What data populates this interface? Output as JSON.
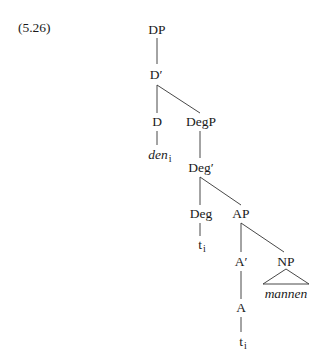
{
  "header_fragment": "",
  "example": {
    "number": "(5.26)"
  },
  "tree": {
    "nodes": {
      "DP": "DP",
      "D_bar": "D′",
      "D": "D",
      "den": "den",
      "den_index": "i",
      "DegP": "DegP",
      "Deg_bar": "Deg′",
      "Deg": "Deg",
      "t1": "t",
      "t1_index": "i",
      "AP": "AP",
      "A_bar": "A′",
      "NP": "NP",
      "mannen": "mannen",
      "A": "A",
      "t2": "t",
      "t2_index": "i"
    },
    "edges": [
      [
        "DP",
        "D′"
      ],
      [
        "D′",
        "D"
      ],
      [
        "D′",
        "DegP"
      ],
      [
        "D",
        "den_i"
      ],
      [
        "DegP",
        "Deg′"
      ],
      [
        "Deg′",
        "Deg"
      ],
      [
        "Deg′",
        "AP"
      ],
      [
        "Deg",
        "t_i"
      ],
      [
        "AP",
        "A′"
      ],
      [
        "AP",
        "NP"
      ],
      [
        "NP",
        "mannen (triangle)"
      ],
      [
        "A′",
        "A"
      ],
      [
        "A",
        "t_i"
      ]
    ]
  }
}
